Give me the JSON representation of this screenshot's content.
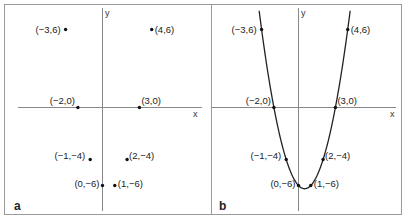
{
  "figure": {
    "panels": [
      {
        "id": "a",
        "label": "a",
        "axis_x_label": "x",
        "axis_y_label": "y",
        "show_curve": false
      },
      {
        "id": "b",
        "label": "b",
        "axis_x_label": "x",
        "axis_y_label": "y",
        "show_curve": true,
        "curve_equation": "y = x^2 - x - 6"
      }
    ],
    "points": [
      {
        "x": -3,
        "y": 6,
        "label": "(−3,6)"
      },
      {
        "x": 4,
        "y": 6,
        "label": "(4,6)"
      },
      {
        "x": -2,
        "y": 0,
        "label": "(−2,0)"
      },
      {
        "x": 3,
        "y": 0,
        "label": "(3,0)"
      },
      {
        "x": -1,
        "y": -4,
        "label": "(−1,−4)"
      },
      {
        "x": 2,
        "y": -4,
        "label": "(2,−4)"
      },
      {
        "x": 0,
        "y": -6,
        "label": "(0,−6)"
      },
      {
        "x": 1,
        "y": -6,
        "label": "(1,−6)"
      }
    ]
  },
  "colors": {
    "frame": "#9a9a9a",
    "axis": "#888888",
    "curve": "#222222",
    "point": "#111111",
    "text": "#222222"
  }
}
